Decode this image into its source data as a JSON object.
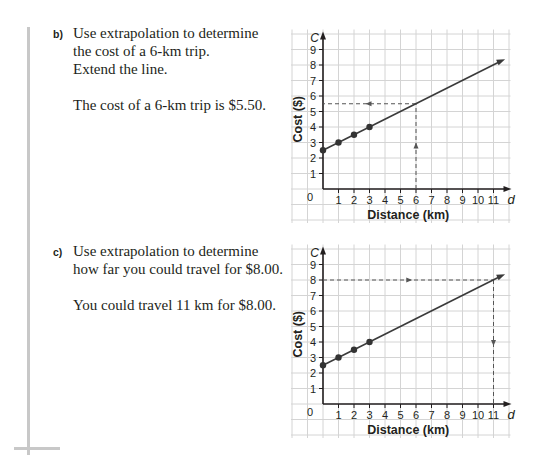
{
  "questions": [
    {
      "label": "b)",
      "lines": [
        "Use extrapolation to determine",
        "the cost of a 6-km trip.",
        "Extend the line."
      ],
      "answer": "The cost of a 6-km trip is $5.50."
    },
    {
      "label": "c)",
      "lines": [
        "Use extrapolation to determine",
        "how far you could travel for $8.00."
      ],
      "answer": "You could travel 11 km for $8.00."
    }
  ],
  "colors": {
    "grid": "#d4d4d4",
    "axis": "#231f20",
    "line": "#3a3a3a",
    "text": "#231f20",
    "margin_bar": "#c8c8c8"
  },
  "chart_data": [
    {
      "type": "line",
      "title": "",
      "xlabel": "Distance (km)",
      "ylabel": "Cost ($)",
      "x_axis_var": "d",
      "y_axis_var": "C",
      "xlim": [
        0,
        11
      ],
      "ylim": [
        0,
        9
      ],
      "x_ticks": [
        1,
        2,
        3,
        4,
        5,
        6,
        7,
        8,
        9,
        10,
        11
      ],
      "y_ticks": [
        1,
        2,
        3,
        4,
        5,
        6,
        7,
        8,
        9
      ],
      "origin_label": "0",
      "grid": true,
      "points": [
        [
          0,
          2.5
        ],
        [
          1,
          3
        ],
        [
          2,
          3.5
        ],
        [
          3,
          4
        ]
      ],
      "line": {
        "equation": "C = 2.5 + 0.5d",
        "from": [
          0,
          2.5
        ],
        "to": [
          11.75,
          8.375
        ]
      },
      "guides": [
        {
          "from": [
            6,
            0
          ],
          "to": [
            6,
            5.5
          ],
          "arrow": "up"
        },
        {
          "from": [
            6,
            5.5
          ],
          "to": [
            0,
            5.5
          ],
          "arrow": "left"
        }
      ]
    },
    {
      "type": "line",
      "title": "",
      "xlabel": "Distance (km)",
      "ylabel": "Cost ($)",
      "x_axis_var": "d",
      "y_axis_var": "C",
      "xlim": [
        0,
        11
      ],
      "ylim": [
        0,
        9
      ],
      "x_ticks": [
        1,
        2,
        3,
        4,
        5,
        6,
        7,
        8,
        9,
        10,
        11
      ],
      "y_ticks": [
        1,
        2,
        3,
        4,
        5,
        6,
        7,
        8,
        9
      ],
      "origin_label": "0",
      "grid": true,
      "points": [
        [
          0,
          2.5
        ],
        [
          1,
          3
        ],
        [
          2,
          3.5
        ],
        [
          3,
          4
        ]
      ],
      "line": {
        "equation": "C = 2.5 + 0.5d",
        "from": [
          0,
          2.5
        ],
        "to": [
          11.75,
          8.375
        ]
      },
      "guides": [
        {
          "from": [
            0,
            8
          ],
          "to": [
            11,
            8
          ],
          "arrow": "right"
        },
        {
          "from": [
            11,
            8
          ],
          "to": [
            11,
            0
          ],
          "arrow": "down"
        }
      ]
    }
  ]
}
